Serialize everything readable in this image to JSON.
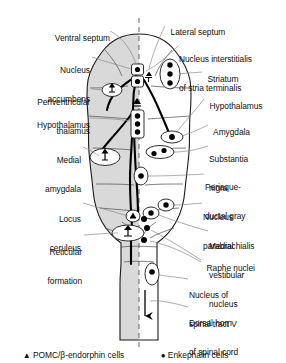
{
  "figure": {
    "title_absent": true,
    "midline": "dashed vertical midline",
    "left_half_shading": "#d8d8d8",
    "right_half_shading": "#ffffff",
    "outline_color": "#1a1a1a",
    "leader_line_color": "#6b6b6b",
    "pathway_color": "#000000"
  },
  "labels_left": [
    {
      "id": "ventral-septum",
      "text": "Ventral septum",
      "x": 108,
      "y": 28,
      "lines": [
        "Ventral septum"
      ]
    },
    {
      "id": "nucleus-accumbens",
      "text": "Nucleus accumbens",
      "x": 88,
      "y": 52,
      "lines": [
        "Nucleus",
        "accumbens"
      ]
    },
    {
      "id": "periventricular-thalamus",
      "text": "Periventricular thalamus",
      "x": 88,
      "y": 84,
      "lines": [
        "Periventricular",
        "thalamus"
      ]
    },
    {
      "id": "hypothalamus-left",
      "text": "Hypothalamus",
      "x": 88,
      "y": 115,
      "lines": [
        "Hypothalamus"
      ]
    },
    {
      "id": "medial-amygdala",
      "text": "Medial amygdala",
      "x": 80,
      "y": 142,
      "lines": [
        "Medial",
        "amygdala"
      ]
    },
    {
      "id": "locus-ceruleus",
      "text": "Locus ceruleus",
      "x": 80,
      "y": 200,
      "lines": [
        "Locus",
        "ceruleus"
      ]
    },
    {
      "id": "reticular-formation",
      "text": "Reticular formation",
      "x": 80,
      "y": 233,
      "lines": [
        "Reticular",
        "formation"
      ]
    }
  ],
  "labels_right": [
    {
      "id": "lateral-septum",
      "text": "Lateral septum",
      "x": 167,
      "y": 22,
      "lines": [
        "Lateral septum"
      ]
    },
    {
      "id": "nucleus-interstitialis",
      "text": "Nucleus interstitialis of stria terminalis",
      "x": 180,
      "y": 40,
      "lines": [
        "Nucleus interstitialis",
        "of stria terminalis"
      ]
    },
    {
      "id": "striatum",
      "text": "Striatum",
      "x": 204,
      "y": 69,
      "lines": [
        "Striatum"
      ]
    },
    {
      "id": "hypothalamus-right",
      "text": "Hypothalamus",
      "x": 206,
      "y": 96,
      "lines": [
        "Hypothalamus"
      ]
    },
    {
      "id": "amygdala",
      "text": "Amygdala",
      "x": 210,
      "y": 122,
      "lines": [
        "Amygdala"
      ]
    },
    {
      "id": "substantia-nigra",
      "text": "Substantia nigra",
      "x": 210,
      "y": 140,
      "lines": [
        "Substantia",
        "nigra"
      ]
    },
    {
      "id": "periaqueductal-gray",
      "text": "Periaqueductal gray",
      "x": 206,
      "y": 168,
      "lines": [
        "Periaque-",
        "ductal gray"
      ]
    },
    {
      "id": "nucleus-parabrachialis",
      "text": "Nucleus parabrachialis",
      "x": 204,
      "y": 198,
      "lines": [
        "Nucleus",
        "parabrachialis"
      ]
    },
    {
      "id": "medial-vestibular-nucleus",
      "text": "Medial vestibular nucleus",
      "x": 210,
      "y": 227,
      "lines": [
        "Medial",
        "vestibular",
        "nucleus"
      ]
    },
    {
      "id": "raphe-nuclei",
      "text": "Raphe nuclei",
      "x": 203,
      "y": 258,
      "lines": [
        "Raphe nuclei"
      ]
    },
    {
      "id": "nucleus-spinal-tract-v",
      "text": "Nucleus of spinal tract V",
      "x": 190,
      "y": 276,
      "lines": [
        "Nucleus of",
        "spinal tract V"
      ]
    },
    {
      "id": "dorsal-horn-spinal-cord",
      "text": "Dorsal horn of spinal cord",
      "x": 190,
      "y": 304,
      "lines": [
        "Dorsal horn",
        "of spinal cord"
      ]
    }
  ],
  "legend": {
    "pomc": {
      "marker": "triangle-marker",
      "glyph": "▲",
      "label": "POMC/β-endorphin cells"
    },
    "enkephalin": {
      "marker": "dot-marker",
      "glyph": "●",
      "label": "Enkephalin cells"
    }
  }
}
